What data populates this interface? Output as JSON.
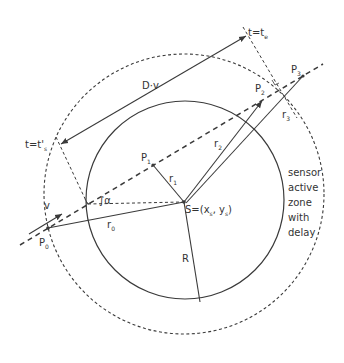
{
  "diagram": {
    "type": "geometry-illustration",
    "title": "",
    "colors": {
      "stroke": "#3a3a3a",
      "text": "#333333",
      "background": "#ffffff"
    },
    "labels": {
      "te": {
        "main": "t=t",
        "sub": "e"
      },
      "ts": {
        "main": "t=t'",
        "sub": "s"
      },
      "dv": "D·v",
      "v": "v",
      "alpha": "α",
      "p0": {
        "main": "P",
        "sub": "0"
      },
      "p1": {
        "main": "P",
        "sub": "1"
      },
      "p2": {
        "main": "P",
        "sub": "2"
      },
      "p3": {
        "main": "P",
        "sub": "3"
      },
      "r0": {
        "main": "r",
        "sub": "0"
      },
      "r1": {
        "main": "r",
        "sub": "1"
      },
      "r2": {
        "main": "r",
        "sub": "2"
      },
      "r3": {
        "main": "r",
        "sub": "3"
      },
      "R": "R",
      "s": {
        "prefix": "S=(x",
        "sub1": "s",
        "mid": ", y",
        "sub2": "s",
        "suffix": ")"
      },
      "zone": [
        "sensor",
        "active",
        "zone",
        "with",
        "delay"
      ]
    },
    "elements": {
      "sensor_circle": {
        "style": "solid",
        "radius_label": "R"
      },
      "delay_zone_circle": {
        "style": "dashed"
      },
      "trajectory": {
        "style": "dashed",
        "points": [
          "P0",
          "P1",
          "P2",
          "P3"
        ]
      }
    }
  }
}
